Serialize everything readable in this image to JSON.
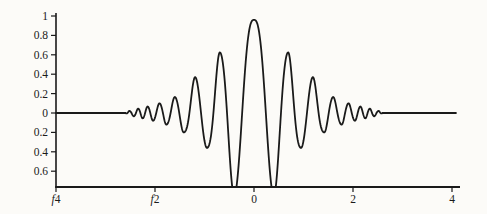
{
  "figure": {
    "width": 487,
    "height": 214,
    "background": "#fcfbf8",
    "ink_color": "#1a1a1a"
  },
  "chart_data": {
    "type": "line",
    "title": "",
    "xlabel": "",
    "ylabel": "",
    "xlim": [
      -4,
      4.1
    ],
    "ylim": [
      -0.78,
      1.0
    ],
    "grid": false,
    "legend": "none",
    "x_ticks": [
      {
        "value": -4,
        "label": "f4",
        "minus_as_f": true
      },
      {
        "value": -2,
        "label": "f2",
        "minus_as_f": true
      },
      {
        "value": 0,
        "label": "0",
        "minus_as_f": false
      },
      {
        "value": 2,
        "label": "2",
        "minus_as_f": false
      },
      {
        "value": 4,
        "label": "4",
        "minus_as_f": false
      }
    ],
    "y_ticks": [
      {
        "value": 1,
        "label": "1"
      },
      {
        "value": 0.8,
        "label": "0.8"
      },
      {
        "value": 0.6,
        "label": "0.6"
      },
      {
        "value": 0.4,
        "label": "0.4"
      },
      {
        "value": 0.2,
        "label": "0.2"
      },
      {
        "value": 0,
        "label": "0"
      },
      {
        "value": -0.2,
        "label": "0.2"
      },
      {
        "value": -0.4,
        "label": "0.4"
      },
      {
        "value": -0.6,
        "label": "0.6"
      }
    ],
    "series": [
      {
        "name": "oscillatory-pulse",
        "color": "#1a1a1a",
        "model": "even-chirp-through-extrema",
        "extrema": [
          [
            0.0,
            0.96
          ],
          [
            0.4,
            -0.85
          ],
          [
            0.69,
            0.625
          ],
          [
            0.95,
            -0.36
          ],
          [
            1.19,
            0.37
          ],
          [
            1.42,
            -0.2
          ],
          [
            1.6,
            0.165
          ],
          [
            1.77,
            -0.12
          ],
          [
            1.91,
            0.1
          ],
          [
            2.04,
            -0.08
          ],
          [
            2.15,
            0.067
          ],
          [
            2.25,
            -0.055
          ],
          [
            2.34,
            0.045
          ],
          [
            2.43,
            -0.034
          ],
          [
            2.52,
            0.021
          ],
          [
            2.59,
            -0.004
          ]
        ],
        "first_lobe_phase_warp": 1.35,
        "flat_beyond": 2.59,
        "clip_min": -0.763
      }
    ]
  },
  "layout_px": {
    "x_origin": 254,
    "px_per_x_unit": 49.5,
    "y_zero": 113,
    "px_per_y_unit": 97,
    "axis_top": 13,
    "axis_bottom": 187,
    "axis_left": 56,
    "axis_right": 460,
    "curve_x_end": 4.08,
    "tick_len": 5
  }
}
